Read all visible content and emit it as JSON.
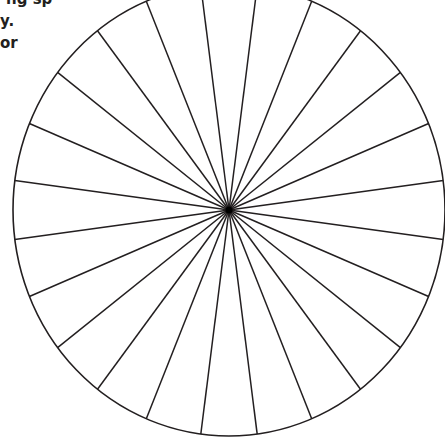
{
  "text": {
    "lines": [
      "ng sp",
      "y.",
      "or"
    ]
  },
  "diagram": {
    "type": "spoked-circle",
    "spoke_count": 24,
    "spoke_angle_step_deg": 15,
    "spoke_offset_deg": 7.5,
    "center": [
      229,
      210
    ],
    "radius_x": 216,
    "radius_y": 226,
    "stroke_color": "#231f20",
    "fill_color": "#ffffff"
  }
}
